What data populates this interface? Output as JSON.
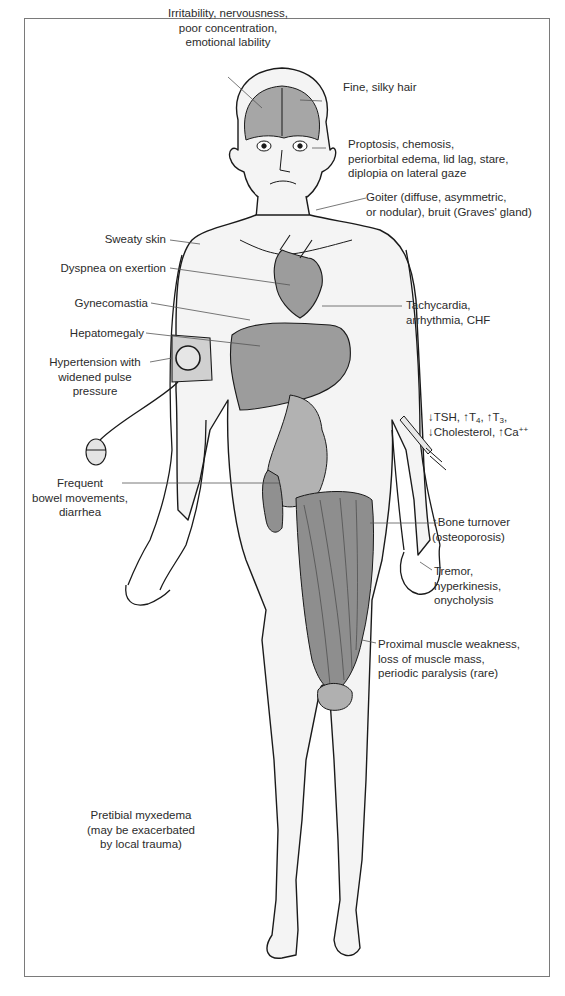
{
  "diagram": {
    "colors": {
      "frame": "#7a7a7a",
      "skin": "#f4f4f4",
      "outline": "#1a1a1a",
      "organ": "#9c9c9c",
      "organ_dark": "#7e7e7e",
      "leader": "#555555",
      "text": "#2b2b2b"
    },
    "labels": {
      "irritability": [
        "Irritability, nervousness,",
        "poor concentration,",
        "emotional lability"
      ],
      "hair": [
        "Fine, silky hair"
      ],
      "eyes": [
        "Proptosis, chemosis,",
        "periorbital edema, lid lag, stare,",
        "diplopia on lateral gaze"
      ],
      "goiter": [
        "Goiter (diffuse, asymmetric,",
        "or nodular), bruit (Graves' gland)"
      ],
      "sweaty_skin": [
        "Sweaty skin"
      ],
      "dyspnea": [
        "Dyspnea on exertion"
      ],
      "tachycardia": [
        "Tachycardia,",
        "arrhythmia, CHF"
      ],
      "gynecomastia": [
        "Gynecomastia"
      ],
      "hepatomegaly": [
        "Hepatomegaly"
      ],
      "hypertension": [
        "Hypertension with",
        "widened pulse",
        "pressure"
      ],
      "labs": {
        "line1": [
          {
            "arrow": "↓",
            "text": "TSH, "
          },
          {
            "arrow": "↑",
            "text": "T",
            "sub": "4",
            "suffix": ", "
          },
          {
            "arrow": "↑",
            "text": "T",
            "sub": "3",
            "suffix": ","
          }
        ],
        "line2": [
          {
            "arrow": "↓",
            "text": "Cholesterol, "
          },
          {
            "arrow": "↑",
            "text": "Ca",
            "sup": "++"
          }
        ]
      },
      "bowel": [
        "Frequent",
        "bowel movements,",
        "diarrhea"
      ],
      "bone": [
        "↑Bone turnover",
        "(osteoporosis)"
      ],
      "tremor": [
        "Tremor,",
        "hyperkinesis,",
        "onycholysis"
      ],
      "muscle": [
        "Proximal muscle weakness,",
        "loss of muscle mass,",
        "periodic paralysis (rare)"
      ],
      "pretibial": [
        "Pretibial myxedema",
        "(may be exacerbated",
        "by local trauma)"
      ]
    }
  }
}
